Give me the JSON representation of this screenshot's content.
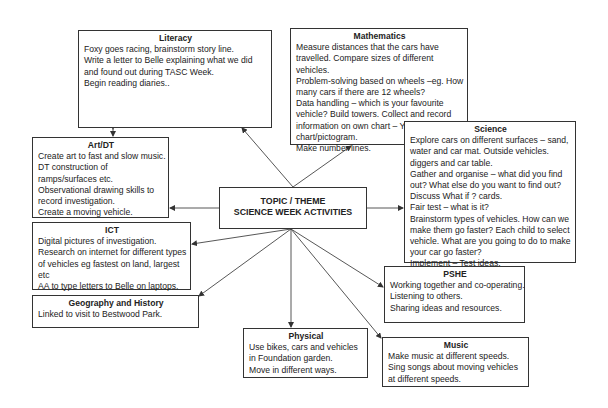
{
  "center": {
    "line1": "TOPIC / THEME",
    "line2": "SCIENCE WEEK ACTIVITIES"
  },
  "boxes": {
    "literacy": {
      "title": "Literacy",
      "lines": [
        "Foxy goes racing, brainstorm story line.",
        "Write a letter to Belle explaining what we did",
        "and found out during TASC Week.",
        "Begin reading diaries.."
      ]
    },
    "mathematics": {
      "title": "Mathematics",
      "lines": [
        "Measure distances that the cars have",
        "travelled. Compare sizes of different",
        "vehicles.",
        "Problem-solving based on wheels –eg. How",
        "many cars if there are 12 wheels?",
        "Data handling – which is your favourite",
        "vehicle? Build towers. Collect and record",
        "information on own chart – Yr 1 using bar",
        "chart/pictogram.",
        "Make number lines."
      ]
    },
    "art_dt": {
      "title": "Art/DT",
      "lines": [
        "Create art to fast and slow music.",
        "DT construction of",
        "ramps/surfaces etc.",
        "Observational drawing skills to",
        "record investigation.",
        "Create  a moving vehicle."
      ]
    },
    "science": {
      "title": "Science",
      "lines": [
        "Explore cars on different surfaces – sand,",
        "water and car mat. Outside vehicles.",
        "diggers and car table.",
        "Gather and organise – what did you find",
        "out? What else do you want to find out?",
        "Discuss What if ? cards.",
        "Fair test – what is it?",
        "Brainstorm types of vehicles. How can we",
        "make them go faster? Each child to select",
        "vehicle. What are you going to do to make",
        "your car go faster?",
        "Implement – Test ideas."
      ]
    },
    "ict": {
      "title": "ICT",
      "lines": [
        "Digital pictures of investigation.",
        "Research on internet for different types",
        "of vehicles eg fastest on land, largest",
        "etc",
        "AA to type letters to Belle on laptops."
      ]
    },
    "geography_history": {
      "title": "Geography and History",
      "lines": [
        "Linked to visit to Bestwood Park."
      ]
    },
    "pshe": {
      "title": "PSHE",
      "lines": [
        "Working together and co-operating.",
        "Listening to others.",
        "Sharing ideas and resources."
      ]
    },
    "physical": {
      "title": "Physical",
      "lines": [
        "Use bikes, cars and vehicles",
        "in Foundation garden.",
        "Move in different ways."
      ]
    },
    "music": {
      "title": "Music",
      "lines": [
        "Make music at different speeds.",
        "Sing songs about moving vehicles",
        "at different speeds."
      ]
    }
  },
  "colors": {
    "line": "#333333",
    "text": "#222222",
    "background": "#ffffff"
  }
}
